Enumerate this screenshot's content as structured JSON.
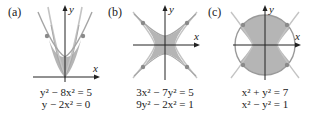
{
  "figure": {
    "panels": [
      {
        "label": "(a)",
        "equations": [
          {
            "text": "y² − 8x² = 5"
          },
          {
            "text": "y − 2x² = 0"
          }
        ],
        "axis_x": "x",
        "axis_y": "y",
        "description": "parabola y = 2x² and upper branch of hyperbola y² − 8x² = 5, shaded region between, two intersection points"
      },
      {
        "label": "(b)",
        "equations": [
          {
            "text": "3x² − 7y² = 5"
          },
          {
            "text": "9y² − 2x² = 1"
          }
        ],
        "axis_x": "x",
        "axis_y": "y",
        "description": "two hyperbolas (horizontal and vertical) with shaded star-shaped region, four intersection points"
      },
      {
        "label": "(c)",
        "equations": [
          {
            "text": "x² + y² = 7"
          },
          {
            "text": "x² − y² = 1"
          }
        ],
        "axis_x": "x",
        "axis_y": "y",
        "description": "circle and hyperbola, shaded region inside circle between hyperbola branches, four intersection points"
      }
    ],
    "colors": {
      "shade": "#b5b5b5",
      "curve": "#9a9a9a",
      "curve_light": "#c8c8c8",
      "axis": "#222222",
      "point": "#8a8a8a"
    }
  }
}
